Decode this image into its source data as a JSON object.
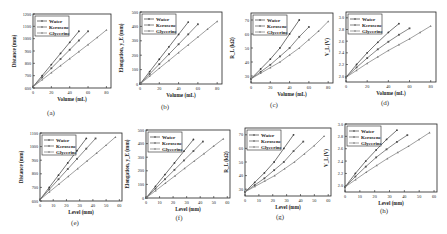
{
  "legend": [
    "Water",
    "Kerosene",
    "Glycerine"
  ],
  "series_colors": [
    "#3a3a3a",
    "#555555",
    "#777777"
  ],
  "chart_data": [
    {
      "id": "a",
      "caption": "(a)",
      "type": "line",
      "xlabel": "Volume (mL)",
      "ylabel": "Distance (mm)",
      "xlim": [
        0,
        85
      ],
      "ylim": [
        600,
        1200
      ],
      "xticks": [
        0,
        20,
        40,
        60,
        80
      ],
      "yticks": [
        600,
        700,
        800,
        900,
        1000,
        1100,
        1200
      ],
      "series": [
        {
          "name": "Water",
          "x": [
            0,
            10,
            20,
            30,
            40,
            50
          ],
          "y": [
            610,
            700,
            790,
            880,
            970,
            1060
          ]
        },
        {
          "name": "Kerosene",
          "x": [
            0,
            10,
            20,
            30,
            40,
            50,
            60
          ],
          "y": [
            610,
            685,
            760,
            835,
            910,
            985,
            1060
          ]
        },
        {
          "name": "Glycerine",
          "x": [
            0,
            10,
            20,
            30,
            40,
            50,
            60,
            70,
            80
          ],
          "y": [
            610,
            667,
            724,
            781,
            838,
            895,
            952,
            1010,
            1070
          ]
        }
      ]
    },
    {
      "id": "b",
      "caption": "(b)",
      "type": "line",
      "xlabel": "Volume (mL)",
      "ylabel": "Elongation, y_E (mm)",
      "xlim": [
        0,
        85
      ],
      "ylim": [
        0,
        500
      ],
      "xticks": [
        0,
        20,
        40,
        60,
        80
      ],
      "yticks": [
        0,
        100,
        200,
        300,
        400,
        500
      ],
      "series": [
        {
          "name": "Water",
          "x": [
            0,
            10,
            20,
            30,
            40,
            50
          ],
          "y": [
            0,
            86,
            172,
            258,
            344,
            430
          ]
        },
        {
          "name": "Kerosene",
          "x": [
            0,
            10,
            20,
            30,
            40,
            50,
            60
          ],
          "y": [
            0,
            69,
            138,
            207,
            276,
            345,
            415
          ]
        },
        {
          "name": "Glycerine",
          "x": [
            0,
            10,
            20,
            30,
            40,
            50,
            60,
            70,
            80
          ],
          "y": [
            0,
            54,
            109,
            163,
            218,
            272,
            326,
            381,
            435
          ]
        }
      ]
    },
    {
      "id": "c",
      "caption": "(c)",
      "type": "line",
      "xlabel": "Volume (mL)",
      "ylabel": "R_L (kΩ)",
      "xlim": [
        0,
        85
      ],
      "ylim": [
        25,
        75
      ],
      "xticks": [
        0,
        20,
        40,
        60,
        80
      ],
      "yticks": [
        30,
        40,
        50,
        60,
        70
      ],
      "series": [
        {
          "name": "Water",
          "x": [
            0,
            10,
            20,
            30,
            40,
            50
          ],
          "y": [
            28,
            35,
            42,
            50,
            60,
            70
          ]
        },
        {
          "name": "Kerosene",
          "x": [
            0,
            10,
            20,
            30,
            40,
            50,
            60
          ],
          "y": [
            28,
            33,
            38,
            44,
            50,
            58,
            65
          ]
        },
        {
          "name": "Glycerine",
          "x": [
            0,
            10,
            20,
            30,
            40,
            50,
            60,
            70,
            80
          ],
          "y": [
            28,
            32,
            36,
            40,
            45,
            50,
            56,
            62,
            69
          ]
        }
      ]
    },
    {
      "id": "d",
      "caption": "(d)",
      "type": "line",
      "xlabel": "Volume (mL)",
      "ylabel": "V_L (V)",
      "xlim": [
        0,
        85
      ],
      "ylim": [
        1.9,
        3.1
      ],
      "xticks": [
        0,
        20,
        40,
        60,
        80
      ],
      "yticks": [
        2.0,
        2.2,
        2.4,
        2.6,
        2.8,
        3.0
      ],
      "series": [
        {
          "name": "Water",
          "x": [
            0,
            10,
            20,
            30,
            40,
            50
          ],
          "y": [
            1.98,
            2.2,
            2.4,
            2.58,
            2.75,
            2.9
          ]
        },
        {
          "name": "Kerosene",
          "x": [
            0,
            10,
            20,
            30,
            40,
            50,
            60
          ],
          "y": [
            1.98,
            2.15,
            2.31,
            2.46,
            2.59,
            2.71,
            2.82
          ]
        },
        {
          "name": "Glycerine",
          "x": [
            0,
            10,
            20,
            30,
            40,
            50,
            60,
            70,
            80
          ],
          "y": [
            1.98,
            2.1,
            2.22,
            2.33,
            2.44,
            2.54,
            2.64,
            2.75,
            2.86
          ]
        }
      ]
    },
    {
      "id": "e",
      "caption": "(e)",
      "type": "line",
      "xlabel": "Level (mm)",
      "ylabel": "Distance (mm)",
      "xlim": [
        0,
        62
      ],
      "ylim": [
        600,
        1100
      ],
      "xticks": [
        0,
        10,
        20,
        30,
        40,
        50,
        60
      ],
      "yticks": [
        600,
        700,
        800,
        900,
        1000,
        1100
      ],
      "series": [
        {
          "name": "Water",
          "x": [
            0,
            7,
            14,
            21,
            28,
            35
          ],
          "y": [
            610,
            700,
            790,
            880,
            970,
            1060
          ]
        },
        {
          "name": "Kerosene",
          "x": [
            0,
            7,
            14,
            21,
            28,
            35,
            42
          ],
          "y": [
            610,
            685,
            760,
            835,
            910,
            985,
            1060
          ]
        },
        {
          "name": "Glycerine",
          "x": [
            0,
            7.1,
            14.3,
            21.4,
            28.5,
            35.6,
            42.8,
            49.9,
            57
          ],
          "y": [
            610,
            667,
            724,
            781,
            838,
            895,
            952,
            1010,
            1070
          ]
        }
      ]
    },
    {
      "id": "f",
      "caption": "(f)",
      "type": "line",
      "xlabel": "Level (mm)",
      "ylabel": "Elongation, y_E (mm)",
      "xlim": [
        0,
        62
      ],
      "ylim": [
        0,
        500
      ],
      "xticks": [
        0,
        10,
        20,
        30,
        40,
        50,
        60
      ],
      "yticks": [
        0,
        100,
        200,
        300,
        400,
        500
      ],
      "series": [
        {
          "name": "Water",
          "x": [
            0,
            7,
            14,
            21,
            28,
            35
          ],
          "y": [
            0,
            86,
            172,
            258,
            344,
            430
          ]
        },
        {
          "name": "Kerosene",
          "x": [
            0,
            7,
            14,
            21,
            28,
            35,
            42
          ],
          "y": [
            0,
            69,
            138,
            207,
            276,
            345,
            415
          ]
        },
        {
          "name": "Glycerine",
          "x": [
            0,
            7.1,
            14.3,
            21.4,
            28.5,
            35.6,
            42.8,
            49.9,
            57
          ],
          "y": [
            0,
            54,
            109,
            163,
            218,
            272,
            326,
            381,
            435
          ]
        }
      ]
    },
    {
      "id": "g",
      "caption": "(g)",
      "type": "line",
      "xlabel": "Level (mm)",
      "ylabel": "R_L (kΩ)",
      "xlim": [
        0,
        62
      ],
      "ylim": [
        25,
        75
      ],
      "xticks": [
        0,
        10,
        20,
        30,
        40,
        50,
        60
      ],
      "yticks": [
        30,
        40,
        50,
        60,
        70
      ],
      "series": [
        {
          "name": "Water",
          "x": [
            0,
            7,
            14,
            21,
            28,
            35
          ],
          "y": [
            28,
            35,
            42,
            50,
            60,
            70
          ]
        },
        {
          "name": "Kerosene",
          "x": [
            0,
            7,
            14,
            21,
            28,
            35,
            42
          ],
          "y": [
            28,
            33,
            38,
            44,
            50,
            58,
            65
          ]
        },
        {
          "name": "Glycerine",
          "x": [
            0,
            7.1,
            14.3,
            21.4,
            28.5,
            35.6,
            42.8,
            49.9,
            57
          ],
          "y": [
            28,
            32,
            36,
            40,
            45,
            50,
            56,
            62,
            69
          ]
        }
      ]
    },
    {
      "id": "h",
      "caption": "(h)",
      "type": "line",
      "xlabel": "Level (mm)",
      "ylabel": "V_L (V)",
      "xlim": [
        0,
        62
      ],
      "ylim": [
        1.9,
        3.0
      ],
      "xticks": [
        0,
        10,
        20,
        30,
        40,
        50,
        60
      ],
      "yticks": [
        2.0,
        2.2,
        2.4,
        2.6,
        2.8,
        3.0
      ],
      "series": [
        {
          "name": "Water",
          "x": [
            0,
            7,
            14,
            21,
            28,
            35
          ],
          "y": [
            1.98,
            2.2,
            2.4,
            2.58,
            2.75,
            2.9
          ]
        },
        {
          "name": "Kerosene",
          "x": [
            0,
            7,
            14,
            21,
            28,
            35,
            42
          ],
          "y": [
            1.98,
            2.15,
            2.31,
            2.46,
            2.59,
            2.71,
            2.82
          ]
        },
        {
          "name": "Glycerine",
          "x": [
            0,
            7.1,
            14.3,
            21.4,
            28.5,
            35.6,
            42.8,
            49.9,
            57
          ],
          "y": [
            1.98,
            2.1,
            2.22,
            2.33,
            2.44,
            2.54,
            2.64,
            2.75,
            2.86
          ]
        }
      ]
    }
  ]
}
